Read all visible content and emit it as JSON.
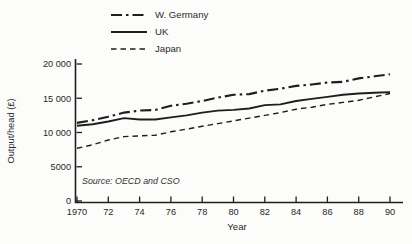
{
  "figure": {
    "background": "#fcfcfb",
    "ink": "#1e1e1e"
  },
  "source_note": "Source: OECD and CSO",
  "chart_data": {
    "type": "line",
    "title": "",
    "xlabel": "Year",
    "ylabel": "Output/head (£)",
    "xlim": [
      1970,
      1990
    ],
    "ylim": [
      0,
      20000
    ],
    "grid": false,
    "legend_position": "above-plot-left",
    "x": [
      1970,
      1971,
      1972,
      1973,
      1974,
      1975,
      1976,
      1977,
      1978,
      1979,
      1980,
      1981,
      1982,
      1983,
      1984,
      1985,
      1986,
      1987,
      1988,
      1989,
      1990
    ],
    "x_ticks": [
      1970,
      1972,
      1974,
      1976,
      1978,
      1980,
      1982,
      1984,
      1986,
      1988,
      1990
    ],
    "x_tick_labels": [
      "1970",
      "72",
      "74",
      "76",
      "78",
      "80",
      "82",
      "84",
      "86",
      "88",
      "90"
    ],
    "y_ticks": [
      0,
      5000,
      10000,
      15000,
      20000
    ],
    "y_tick_labels": [
      "0",
      "5000",
      "10 000",
      "15 000",
      "20 000"
    ],
    "series": [
      {
        "name": "W. Germany",
        "line_style": "dash-dot",
        "values": [
          11400,
          11800,
          12300,
          12900,
          13200,
          13300,
          13900,
          14200,
          14600,
          15100,
          15500,
          15600,
          16100,
          16400,
          16800,
          17000,
          17300,
          17400,
          17900,
          18200,
          18500
        ]
      },
      {
        "name": "UK",
        "line_style": "solid",
        "values": [
          11000,
          11200,
          11600,
          12100,
          11900,
          11900,
          12200,
          12500,
          12900,
          13200,
          13300,
          13500,
          14000,
          14100,
          14600,
          14900,
          15200,
          15500,
          15700,
          15800,
          15900
        ]
      },
      {
        "name": "Japan",
        "line_style": "dashed",
        "values": [
          7700,
          8200,
          8900,
          9400,
          9500,
          9600,
          10100,
          10500,
          10900,
          11300,
          11700,
          12100,
          12500,
          12900,
          13400,
          13700,
          14100,
          14400,
          14700,
          15200,
          15700
        ]
      }
    ]
  }
}
